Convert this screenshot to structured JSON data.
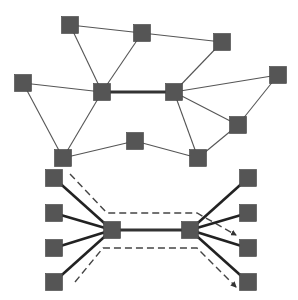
{
  "diagram": {
    "type": "network-graph",
    "colors": {
      "node_fill": "#555555",
      "node_stroke": "#444444",
      "edge_thin": "#555555",
      "edge_thick": "#333333",
      "edge_bundle": "#222222",
      "dashed": "#444444",
      "background": "#ffffff"
    },
    "node_size": 17,
    "top_graph": {
      "nodes": [
        {
          "id": "A",
          "x": 70,
          "y": 25
        },
        {
          "id": "B",
          "x": 142,
          "y": 33
        },
        {
          "id": "C",
          "x": 222,
          "y": 42
        },
        {
          "id": "D",
          "x": 23,
          "y": 83
        },
        {
          "id": "E",
          "x": 102,
          "y": 92
        },
        {
          "id": "F",
          "x": 174,
          "y": 92
        },
        {
          "id": "G",
          "x": 278,
          "y": 75
        },
        {
          "id": "H",
          "x": 238,
          "y": 125
        },
        {
          "id": "I",
          "x": 135,
          "y": 141
        },
        {
          "id": "J",
          "x": 63,
          "y": 158
        },
        {
          "id": "K",
          "x": 198,
          "y": 158
        }
      ],
      "edges": [
        {
          "from": "A",
          "to": "B",
          "weight": "thin"
        },
        {
          "from": "B",
          "to": "C",
          "weight": "thin"
        },
        {
          "from": "A",
          "to": "E",
          "weight": "thin"
        },
        {
          "from": "B",
          "to": "E",
          "weight": "thin"
        },
        {
          "from": "C",
          "to": "F",
          "weight": "thin"
        },
        {
          "from": "D",
          "to": "E",
          "weight": "thin"
        },
        {
          "from": "D",
          "to": "J",
          "weight": "thin"
        },
        {
          "from": "E",
          "to": "J",
          "weight": "thin"
        },
        {
          "from": "E",
          "to": "F",
          "weight": "thick"
        },
        {
          "from": "F",
          "to": "G",
          "weight": "thin"
        },
        {
          "from": "F",
          "to": "H",
          "weight": "thin"
        },
        {
          "from": "F",
          "to": "K",
          "weight": "thin"
        },
        {
          "from": "G",
          "to": "H",
          "weight": "thin"
        },
        {
          "from": "J",
          "to": "I",
          "weight": "thin"
        },
        {
          "from": "I",
          "to": "K",
          "weight": "thin"
        },
        {
          "from": "H",
          "to": "K",
          "weight": "thin"
        }
      ]
    },
    "bottom_graph": {
      "nodes": [
        {
          "id": "L1",
          "x": 54,
          "y": 178
        },
        {
          "id": "L2",
          "x": 54,
          "y": 213
        },
        {
          "id": "L3",
          "x": 54,
          "y": 248
        },
        {
          "id": "L4",
          "x": 54,
          "y": 282
        },
        {
          "id": "M",
          "x": 112,
          "y": 230
        },
        {
          "id": "N",
          "x": 190,
          "y": 230
        },
        {
          "id": "R1",
          "x": 248,
          "y": 178
        },
        {
          "id": "R2",
          "x": 248,
          "y": 213
        },
        {
          "id": "R3",
          "x": 248,
          "y": 248
        },
        {
          "id": "R4",
          "x": 248,
          "y": 282
        }
      ],
      "edges": [
        {
          "from": "L1",
          "to": "M",
          "weight": "bold"
        },
        {
          "from": "L2",
          "to": "M",
          "weight": "bold"
        },
        {
          "from": "L3",
          "to": "M",
          "weight": "bold"
        },
        {
          "from": "L4",
          "to": "M",
          "weight": "bold"
        },
        {
          "from": "M",
          "to": "N",
          "weight": "thick"
        },
        {
          "from": "N",
          "to": "R1",
          "weight": "bold"
        },
        {
          "from": "N",
          "to": "R2",
          "weight": "bold"
        },
        {
          "from": "N",
          "to": "R3",
          "weight": "bold"
        },
        {
          "from": "N",
          "to": "R4",
          "weight": "bold"
        }
      ],
      "dashed_paths": [
        {
          "points": [
            [
              70,
              174
            ],
            [
              107,
              213
            ],
            [
              197,
              213
            ],
            [
              236,
              235
            ]
          ],
          "arrow": true
        },
        {
          "points": [
            [
              75,
              282
            ],
            [
              103,
              248
            ],
            [
              197,
              248
            ],
            [
              236,
              287
            ]
          ],
          "arrow": true
        }
      ]
    }
  }
}
